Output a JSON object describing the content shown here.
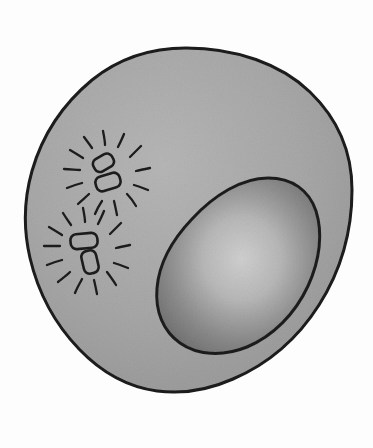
{
  "figure": {
    "kind": "hand-drawn-biological-illustration",
    "width": 373,
    "height": 448,
    "background_color": "#fdfdfe",
    "ink_color": "#1c1c1c"
  },
  "cell": {
    "label": "cell-body",
    "fill_color": "#cccccc",
    "fill_color_light": "#d6d6d6",
    "outline_color": "#1b1b1b",
    "outline_width": 3,
    "bounds": {
      "x_min": 25,
      "y_min": 47,
      "x_max": 353,
      "y_max": 393
    }
  },
  "nucleus": {
    "label": "nucleus",
    "fill_center_color": "#e4e4e4",
    "fill_edge_color": "#adadad",
    "outline_color": "#1f1f1f",
    "outline_width": 3,
    "bounds": {
      "x_min": 155,
      "y_min": 176,
      "x_max": 320,
      "y_max": 352
    },
    "rotation_deg": -35
  },
  "bacteria_clusters": [
    {
      "label": "bacteria-cluster-upper",
      "center": {
        "x": 104,
        "y": 172
      },
      "rod_count": 2,
      "ray_count": 12,
      "rods": [
        {
          "label": "rod-upper",
          "cx": 103,
          "cy": 163,
          "w": 20,
          "h": 13,
          "angle_deg": -28
        },
        {
          "label": "rod-lower",
          "cx": 108,
          "cy": 181,
          "w": 24,
          "h": 14,
          "angle_deg": -18
        }
      ]
    },
    {
      "label": "bacteria-cluster-lower",
      "center": {
        "x": 84,
        "y": 248
      },
      "rod_count": 2,
      "ray_count": 12,
      "rods": [
        {
          "label": "rod-upper",
          "cx": 84,
          "cy": 240,
          "w": 26,
          "h": 14,
          "angle_deg": -6
        },
        {
          "label": "rod-lower",
          "cx": 90,
          "cy": 261,
          "w": 14,
          "h": 22,
          "angle_deg": -14
        }
      ]
    }
  ],
  "accessibility": {
    "alt_text": "Hand drawn diagram of a rounded cell containing a large oval nucleus on the right side and two small clusters of rod shaped bacteria on the left, each drawn with radiating sparkle lines."
  }
}
